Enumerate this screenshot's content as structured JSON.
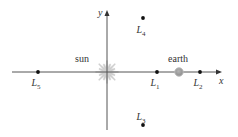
{
  "diagram": {
    "axes": {
      "x_label": "x",
      "y_label": "y",
      "origin": [
        107,
        72
      ],
      "x_range_px": [
        12,
        222
      ],
      "y_range_px": [
        10,
        130
      ],
      "color": "#555555"
    },
    "bodies": [
      {
        "id": "sun",
        "label": "sun",
        "x": 107,
        "y": 72,
        "label_x": 82,
        "label_y": 62,
        "color": "#c8c8c8"
      },
      {
        "id": "earth",
        "label": "earth",
        "x": 179,
        "y": 72,
        "label_x": 178,
        "label_y": 62,
        "color": "#9a9a9a"
      }
    ],
    "points": [
      {
        "id": "L1",
        "base": "L",
        "sub": "1",
        "x": 157,
        "y": 72,
        "label_x": 157,
        "label_y": 86
      },
      {
        "id": "L2",
        "base": "L",
        "sub": "2",
        "x": 200,
        "y": 72,
        "label_x": 200,
        "label_y": 86
      },
      {
        "id": "L3",
        "base": "L",
        "sub": "3",
        "x": 143,
        "y": 125,
        "label_x": 143,
        "label_y": 120
      },
      {
        "id": "L4",
        "base": "L",
        "sub": "4",
        "x": 143,
        "y": 18,
        "label_x": 143,
        "label_y": 33
      },
      {
        "id": "L5",
        "base": "L",
        "sub": "5",
        "x": 38,
        "y": 72,
        "label_x": 38,
        "label_y": 86
      }
    ],
    "point_color": "#111111"
  }
}
